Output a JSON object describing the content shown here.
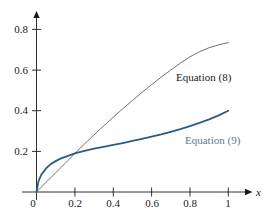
{
  "figure": {
    "background_color": "#ffffff",
    "width": 272,
    "height": 220,
    "axis_color": "#1a1a1a",
    "axis_x_name": "x",
    "axis_y_name": ""
  },
  "axes": {
    "x_ticks": [
      "0",
      "0.2",
      "0.4",
      "0.6",
      "0.8",
      "1"
    ],
    "x_tick_values": [
      0,
      0.2,
      0.4,
      0.6,
      0.8,
      1
    ],
    "y_ticks": [
      "0.2",
      "0.4",
      "0.6",
      "0.8"
    ],
    "y_tick_values": [
      0.2,
      0.4,
      0.6,
      0.8
    ],
    "origin_label": "0",
    "x_min": 0,
    "x_max": 1.05,
    "y_min": 0,
    "y_max": 0.88
  },
  "series": [
    {
      "name": "equation-8",
      "label": "Equation (8)",
      "color": "#4d4d4d",
      "label_color": "#1a1a1a",
      "stroke_width": 0.8,
      "label_x": 0.63,
      "label_y": 0.55
    },
    {
      "name": "equation-9",
      "label": "Equation (9)",
      "color": "#2d5b86",
      "label_color": "#5a7b99",
      "stroke_width": 1.8,
      "label_x": 0.795,
      "label_y": 0.285
    }
  ],
  "chart_data": {
    "type": "line",
    "title": "",
    "xlabel": "x",
    "ylabel": "",
    "xlim": [
      0,
      1.05
    ],
    "ylim": [
      0,
      0.88
    ],
    "grid": false,
    "legend_position": "inline-annotation",
    "x_tick_labels": [
      "0",
      "0.2",
      "0.4",
      "0.6",
      "0.8",
      "1"
    ],
    "y_tick_labels": [
      "0.2",
      "0.4",
      "0.6",
      "0.8"
    ],
    "annotations": [
      "Equation (8)",
      "Equation (9)"
    ],
    "crossing_point": [
      0.2,
      0.19
    ],
    "series": [
      {
        "name": "Equation (8)",
        "color": "#4d4d4d",
        "x": [
          0,
          0.05,
          0.1,
          0.15,
          0.2,
          0.25,
          0.3,
          0.35,
          0.4,
          0.45,
          0.5,
          0.55,
          0.6,
          0.65,
          0.7,
          0.75,
          0.8,
          0.85,
          0.9,
          0.95,
          1
        ],
        "values": [
          0,
          0.048,
          0.095,
          0.142,
          0.19,
          0.236,
          0.281,
          0.325,
          0.368,
          0.41,
          0.45,
          0.49,
          0.528,
          0.565,
          0.6,
          0.634,
          0.665,
          0.69,
          0.71,
          0.724,
          0.735
        ]
      },
      {
        "name": "Equation (9)",
        "color": "#2d5b86",
        "x": [
          0,
          0.01,
          0.025,
          0.05,
          0.075,
          0.1,
          0.125,
          0.15,
          0.2,
          0.25,
          0.3,
          0.35,
          0.4,
          0.45,
          0.5,
          0.55,
          0.6,
          0.65,
          0.7,
          0.75,
          0.8,
          0.85,
          0.9,
          0.95,
          1
        ],
        "values": [
          0,
          0.052,
          0.085,
          0.116,
          0.138,
          0.152,
          0.164,
          0.173,
          0.19,
          0.202,
          0.213,
          0.222,
          0.232,
          0.241,
          0.251,
          0.261,
          0.272,
          0.283,
          0.296,
          0.309,
          0.324,
          0.34,
          0.357,
          0.377,
          0.4
        ]
      }
    ]
  }
}
